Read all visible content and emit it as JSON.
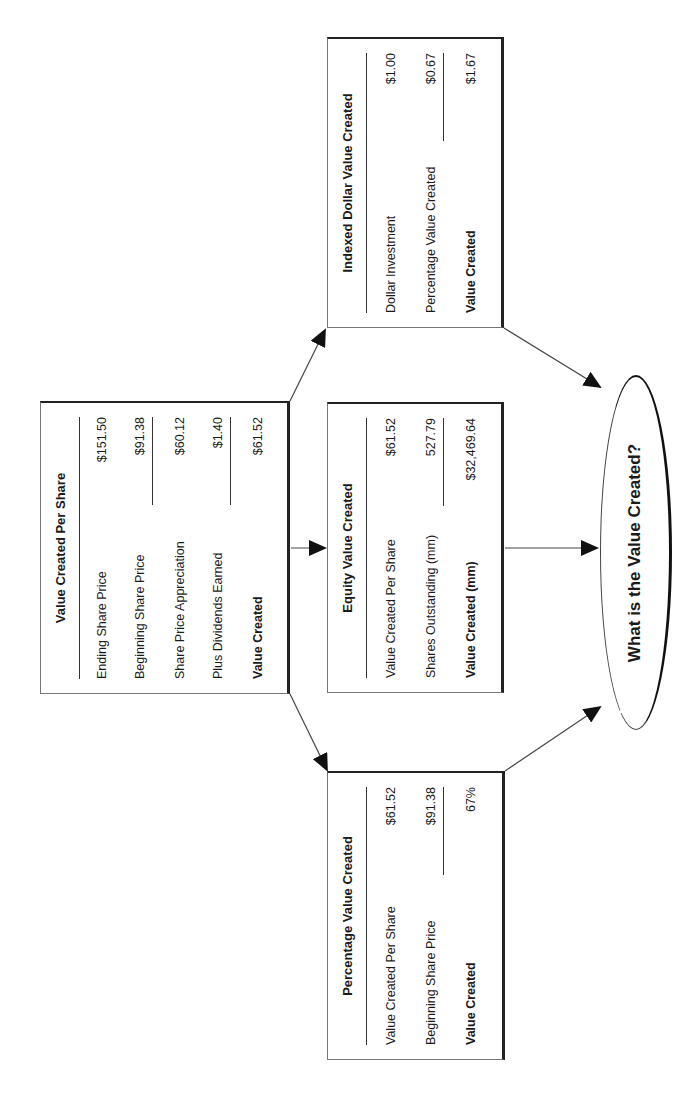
{
  "diagram": {
    "center_box": {
      "title": "Value Created Per Share",
      "rows": [
        {
          "label": "Ending Share Price",
          "value": "$151.50",
          "underline": false,
          "bold": false
        },
        {
          "label": "Beginning Share Price",
          "value": "$91.38",
          "underline": true,
          "bold": false
        },
        {
          "label": "Share Price Appreciation",
          "value": "$60.12",
          "underline": false,
          "bold": false
        },
        {
          "label": "Plus Dividends Earned",
          "value": "$1.40",
          "underline": true,
          "bold": false
        },
        {
          "label": "Value Created",
          "value": "$61.52",
          "underline": false,
          "bold": true
        }
      ]
    },
    "indexed_box": {
      "title": "Indexed Dollar Value Created",
      "rows": [
        {
          "label": "Dollar Investment",
          "value": "$1.00",
          "underline": false,
          "bold": false
        },
        {
          "label": "Percentage Value Created",
          "value": "$0.67",
          "underline": true,
          "bold": false
        },
        {
          "label": "Value Created",
          "value": "$1.67",
          "underline": false,
          "bold": true
        }
      ]
    },
    "equity_box": {
      "title": "Equity Value Created",
      "rows": [
        {
          "label": "Value Created Per Share",
          "value": "$61.52",
          "underline": false,
          "bold": false
        },
        {
          "label": "Shares Outstanding (mm)",
          "value": "527.79",
          "underline": true,
          "bold": false
        },
        {
          "label": "Value Created (mm)",
          "value": "$32,469.64",
          "underline": false,
          "bold": true
        }
      ]
    },
    "percentage_box": {
      "title": "Percentage Value Created",
      "rows": [
        {
          "label": "Value Created Per Share",
          "value": "$61.52",
          "underline": false,
          "bold": false
        },
        {
          "label": "Beginning Share Price",
          "value": "$91.38",
          "underline": true,
          "bold": false
        },
        {
          "label": "Value Created",
          "value": "67%",
          "underline": false,
          "bold": true
        }
      ]
    },
    "ellipse": {
      "label": "What is the Value Created?"
    },
    "orientation": "rotated 90° counter-clockwise",
    "colors": {
      "line": "#1a1a1a",
      "background": "#ffffff"
    }
  }
}
